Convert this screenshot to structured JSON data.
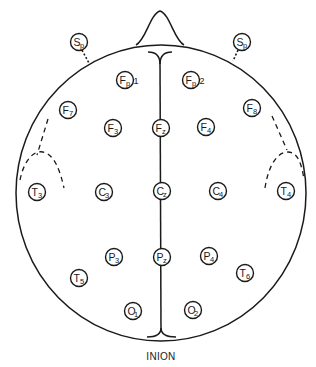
{
  "diagram": {
    "bottom_label": "INION",
    "colors": {
      "line": "#1a1a1a",
      "background": "#ffffff"
    },
    "head": {
      "cx": 161,
      "cy": 193,
      "rx": 145,
      "ry": 148,
      "nose_peak": [
        160,
        10
      ]
    },
    "electrodes": [
      {
        "id": "Sp-left",
        "letter": "S",
        "sub": "p",
        "ext": "",
        "x": 79,
        "y": 42
      },
      {
        "id": "Sp-right",
        "letter": "S",
        "sub": "p",
        "ext": "",
        "x": 242,
        "y": 42
      },
      {
        "id": "Fp1",
        "letter": "F",
        "sub": "p",
        "ext": "1",
        "x": 125,
        "y": 80
      },
      {
        "id": "Fp2",
        "letter": "F",
        "sub": "p",
        "ext": "2",
        "x": 191,
        "y": 80
      },
      {
        "id": "F7",
        "letter": "F",
        "sub": "7",
        "ext": "",
        "x": 68,
        "y": 110
      },
      {
        "id": "F3",
        "letter": "F",
        "sub": "3",
        "ext": "",
        "x": 113,
        "y": 128
      },
      {
        "id": "Fz",
        "letter": "F",
        "sub": "z",
        "ext": "",
        "x": 161,
        "y": 128
      },
      {
        "id": "F4",
        "letter": "F",
        "sub": "4",
        "ext": "",
        "x": 206,
        "y": 127
      },
      {
        "id": "F8",
        "letter": "F",
        "sub": "8",
        "ext": "",
        "x": 252,
        "y": 108
      },
      {
        "id": "T3",
        "letter": "T",
        "sub": "3",
        "ext": "",
        "x": 37,
        "y": 192
      },
      {
        "id": "C3",
        "letter": "C",
        "sub": "3",
        "ext": "",
        "x": 104,
        "y": 192
      },
      {
        "id": "Cz",
        "letter": "C",
        "sub": "z",
        "ext": "",
        "x": 162,
        "y": 191
      },
      {
        "id": "C4",
        "letter": "C",
        "sub": "4",
        "ext": "",
        "x": 218,
        "y": 191
      },
      {
        "id": "T4",
        "letter": "T",
        "sub": "4",
        "ext": "",
        "x": 286,
        "y": 191
      },
      {
        "id": "P3",
        "letter": "P",
        "sub": "3",
        "ext": "",
        "x": 114,
        "y": 257
      },
      {
        "id": "Pz",
        "letter": "P",
        "sub": "z",
        "ext": "",
        "x": 162,
        "y": 257
      },
      {
        "id": "P4",
        "letter": "P",
        "sub": "4",
        "ext": "",
        "x": 209,
        "y": 256
      },
      {
        "id": "T5",
        "letter": "T",
        "sub": "5",
        "ext": "",
        "x": 79,
        "y": 278
      },
      {
        "id": "T6",
        "letter": "T",
        "sub": "6",
        "ext": "",
        "x": 245,
        "y": 273
      },
      {
        "id": "O1",
        "letter": "O",
        "sub": "1",
        "ext": "",
        "x": 133,
        "y": 311
      },
      {
        "id": "O2",
        "letter": "O",
        "sub": "2",
        "ext": "",
        "x": 193,
        "y": 310
      }
    ]
  }
}
